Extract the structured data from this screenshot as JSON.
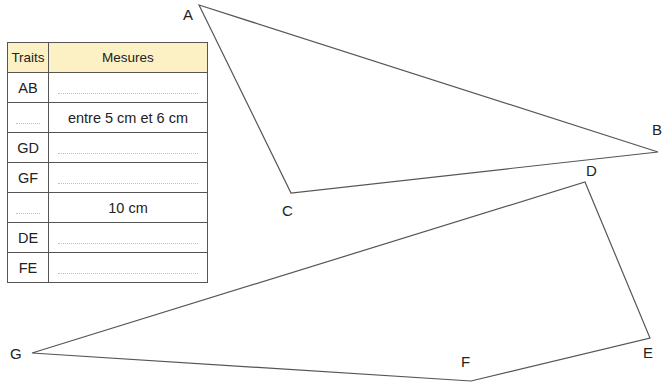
{
  "table": {
    "headers": {
      "col1": "Traits",
      "col2": "Mesures"
    },
    "rows": [
      {
        "trait": "AB",
        "mesure": ""
      },
      {
        "trait": "",
        "mesure": "entre 5 cm et 6 cm"
      },
      {
        "trait": "GD",
        "mesure": ""
      },
      {
        "trait": "GF",
        "mesure": ""
      },
      {
        "trait": "",
        "mesure": "10 cm"
      },
      {
        "trait": "DE",
        "mesure": ""
      },
      {
        "trait": "FE",
        "mesure": ""
      }
    ],
    "header_bg": "#fbf1c5",
    "dotted_line_color": "#8fd0e6"
  },
  "figure": {
    "triangle_ABC": {
      "A": {
        "label": "A",
        "x": 199,
        "y": 5
      },
      "B": {
        "label": "B",
        "x": 658,
        "y": 152
      },
      "C": {
        "label": "C",
        "x": 291,
        "y": 193
      }
    },
    "quadrilateral_DEFG": {
      "D": {
        "label": "D",
        "x": 585,
        "y": 182
      },
      "E": {
        "label": "E",
        "x": 650,
        "y": 338
      },
      "F": {
        "label": "F",
        "x": 471,
        "y": 381
      },
      "G": {
        "label": "G",
        "x": 32,
        "y": 353
      }
    },
    "line_color": "#555555"
  }
}
